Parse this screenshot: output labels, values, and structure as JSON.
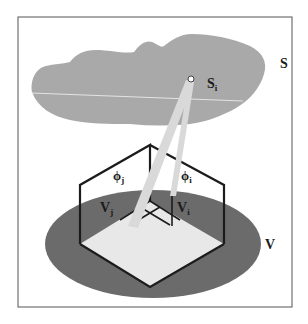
{
  "figure": {
    "colors": {
      "background": "#ffffff",
      "frame": "#555555",
      "surface": "#a9a9a9",
      "surface_line": "#f2f2f2",
      "volume": "#6b6b6b",
      "floor": "#e8e8e8",
      "box_edges": "#1c1c1c",
      "beams": "#d9d9d9"
    },
    "labels": {
      "surface": "S",
      "surface_point_base": "S",
      "surface_point_sub": "i",
      "volume": "V",
      "ray_j_base": "ϕ",
      "ray_j_sub": "j",
      "ray_i_base": "ϕ",
      "ray_i_sub": "i",
      "voxel_j_base": "V",
      "voxel_j_sub": "j",
      "voxel_i_base": "V",
      "voxel_i_sub": "i"
    }
  }
}
